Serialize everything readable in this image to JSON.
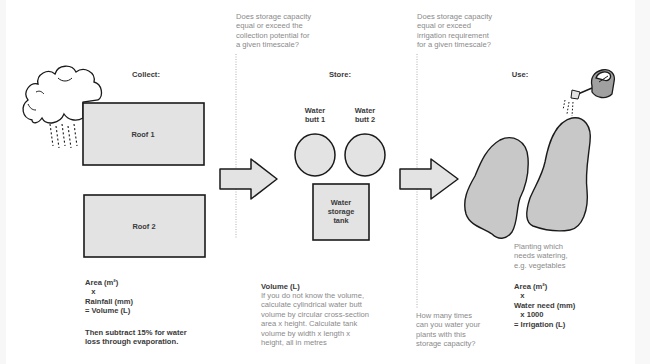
{
  "diagram": {
    "type": "rainwater harvesting flow diagram",
    "colors": {
      "shape_fill": "#e3e3e3",
      "planting_fill": "#c8c8c8",
      "outline": "#1a1a1a",
      "dark_text": "#3a3a3a",
      "light_text": "#8a8a8a",
      "divider": "#9a9a9a"
    }
  },
  "collect": {
    "heading": "Collect:",
    "roofs": [
      {
        "label": "Roof 1"
      },
      {
        "label": "Roof 2"
      }
    ],
    "formula": [
      "Area (m²)",
      "   x",
      "Rainfall (mm)",
      "= Volume (L)"
    ],
    "note": [
      "Then subtract 15% for water",
      "loss through evaporation."
    ]
  },
  "divider1": {
    "question": [
      "Does storage capacity",
      "equal or exceed the",
      "collection potential for",
      "a given timescale?"
    ]
  },
  "store": {
    "heading": "Store:",
    "butts": [
      {
        "label": [
          "Water",
          "butt 1"
        ]
      },
      {
        "label": [
          "Water",
          "butt 2"
        ]
      }
    ],
    "tank": {
      "label": [
        "Water",
        "storage",
        "tank"
      ]
    },
    "formula_title": "Volume (L)",
    "formula_text": [
      "If you do not know the volume,",
      "calculate cylindrical water butt",
      "volume by circular cross-section",
      "area x height. Calculate tank",
      "volume by width x length x",
      "height, all in metres"
    ]
  },
  "divider2": {
    "question": [
      "Does storage capacity",
      "equal or exceed",
      "irrigation requirement",
      "for a given timescale?"
    ],
    "bottom_question": [
      "How many times",
      "can you water your",
      "plants with this",
      "storage capacity?"
    ]
  },
  "use": {
    "heading": "Use:",
    "planting_label": [
      "Planting which",
      "needs watering,",
      "e.g. vegetables"
    ],
    "formula": [
      "Area (m²)",
      "   x",
      "Water need (mm)",
      "   x 1000",
      "= Irrigation (L)"
    ]
  },
  "icons": [
    "rain-cloud-icon",
    "arrow-right-icon",
    "arrow-right-icon",
    "watering-can-icon"
  ]
}
